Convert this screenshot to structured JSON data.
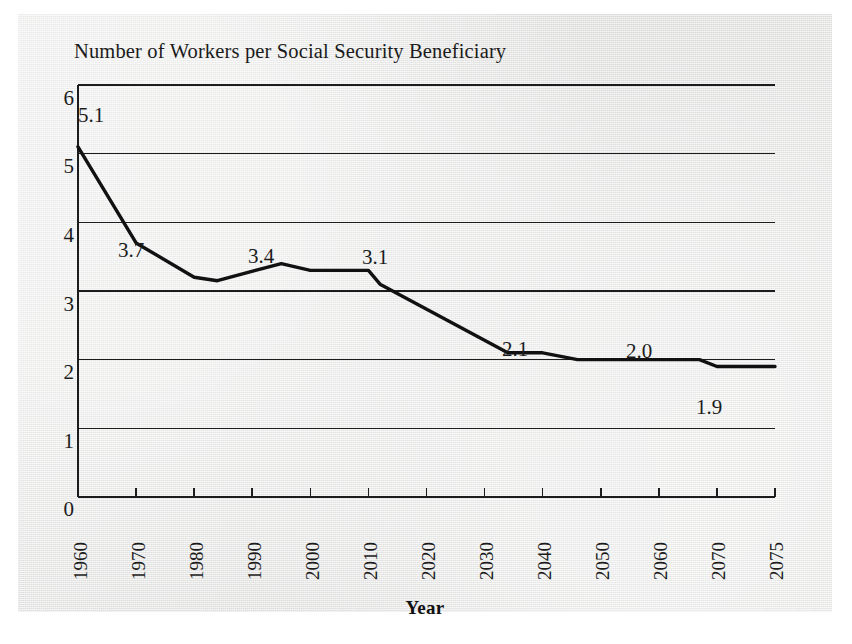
{
  "figure": {
    "title": "Number of Workers per Social Security Beneficiary",
    "xaxis_title": "Year",
    "background_color": "#e6e6e4",
    "ink_color": "#1c1c1c"
  },
  "chart_data": {
    "type": "line",
    "title": "Number of Workers per Social Security Beneficiary",
    "xlabel": "Year",
    "ylabel": "",
    "xlim": [
      1960,
      2075
    ],
    "ylim": [
      0,
      6
    ],
    "grid": true,
    "legend": null,
    "ytick_labels": [
      "6",
      "5",
      "4",
      "3",
      "2",
      "1",
      "0"
    ],
    "ytick_values": [
      6,
      5,
      4,
      3,
      2,
      1,
      0
    ],
    "xtick_labels": [
      "1960",
      "1970",
      "1980",
      "1990",
      "2000",
      "2010",
      "2020",
      "2030",
      "2040",
      "2050",
      "2060",
      "2070",
      "2075"
    ],
    "xtick_values": [
      1960,
      1970,
      1980,
      1990,
      2000,
      2010,
      2020,
      2030,
      2040,
      2050,
      2060,
      2070,
      2075
    ],
    "series": [
      {
        "name": "Workers per beneficiary",
        "x": [
          1960,
          1970,
          1980,
          1984,
          1995,
          2000,
          2010,
          2012,
          2034,
          2040,
          2046,
          2055,
          2067,
          2070,
          2075
        ],
        "values": [
          5.1,
          3.7,
          3.2,
          3.15,
          3.4,
          3.3,
          3.3,
          3.1,
          2.1,
          2.1,
          2.0,
          2.0,
          2.0,
          1.9,
          1.9
        ]
      }
    ],
    "annotations": [
      {
        "label": "5.1",
        "x": 1960,
        "y": 5.1
      },
      {
        "label": "3.7",
        "x": 1970,
        "y": 3.7
      },
      {
        "label": "3.4",
        "x": 1995,
        "y": 3.4
      },
      {
        "label": "3.1",
        "x": 2011,
        "y": 3.1
      },
      {
        "label": "2.1",
        "x": 2034,
        "y": 2.1
      },
      {
        "label": "2.0",
        "x": 2052,
        "y": 2.0
      },
      {
        "label": "1.9",
        "x": 2069,
        "y": 1.9
      }
    ]
  },
  "ytick_labels": [
    {
      "text": "6"
    },
    {
      "text": "5"
    },
    {
      "text": "4"
    },
    {
      "text": "3"
    },
    {
      "text": "2"
    },
    {
      "text": "1"
    },
    {
      "text": "0"
    }
  ],
  "xtick_labels": [
    {
      "text": "1960"
    },
    {
      "text": "1970"
    },
    {
      "text": "1980"
    },
    {
      "text": "1990"
    },
    {
      "text": "2000"
    },
    {
      "text": "2010"
    },
    {
      "text": "2020"
    },
    {
      "text": "2030"
    },
    {
      "text": "2040"
    },
    {
      "text": "2050"
    },
    {
      "text": "2060"
    },
    {
      "text": "2070"
    },
    {
      "text": "2075"
    }
  ],
  "point_labels": [
    {
      "text": "5.1"
    },
    {
      "text": "3.7"
    },
    {
      "text": "3.4"
    },
    {
      "text": "3.1"
    },
    {
      "text": "2.1"
    },
    {
      "text": "2.0"
    },
    {
      "text": "1.9"
    }
  ]
}
